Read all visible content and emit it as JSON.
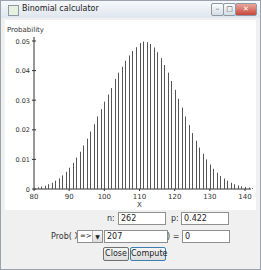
{
  "window": {
    "title": "Binomial calculator",
    "controls": {
      "minimize": "minimize",
      "maximize": "maximize",
      "close": "close"
    }
  },
  "chart_data": {
    "type": "bar",
    "title": "",
    "xlabel": "X",
    "ylabel": "Probability",
    "xlim": [
      80,
      142
    ],
    "ylim": [
      0,
      0.05
    ],
    "x_ticks": [
      "80",
      "90",
      "100",
      "110",
      "120",
      "130",
      "140"
    ],
    "y_ticks": [
      "0",
      "0.01",
      "0.02",
      "0.03",
      "0.04",
      "0.05"
    ],
    "distribution": {
      "n": 262,
      "p": 0.422
    },
    "x": [
      80,
      81,
      82,
      83,
      84,
      85,
      86,
      87,
      88,
      89,
      90,
      91,
      92,
      93,
      94,
      95,
      96,
      97,
      98,
      99,
      100,
      101,
      102,
      103,
      104,
      105,
      106,
      107,
      108,
      109,
      110,
      111,
      112,
      113,
      114,
      115,
      116,
      117,
      118,
      119,
      120,
      121,
      122,
      123,
      124,
      125,
      126,
      127,
      128,
      129,
      130,
      131,
      132,
      133,
      134,
      135,
      136,
      137,
      138,
      139,
      140,
      141,
      142
    ],
    "values": [
      0.0004,
      0.0006,
      0.0008,
      0.0011,
      0.0016,
      0.0021,
      0.0028,
      0.0036,
      0.0046,
      0.0058,
      0.0072,
      0.0088,
      0.0106,
      0.0126,
      0.0147,
      0.017,
      0.0194,
      0.0219,
      0.0245,
      0.027,
      0.0295,
      0.0319,
      0.0341,
      0.0372,
      0.0393,
      0.0413,
      0.0433,
      0.0451,
      0.0466,
      0.0479,
      0.0493,
      0.0498,
      0.0496,
      0.049,
      0.0478,
      0.0462,
      0.0442,
      0.0419,
      0.0393,
      0.0365,
      0.0335,
      0.0305,
      0.0275,
      0.0245,
      0.0216,
      0.0189,
      0.0163,
      0.014,
      0.0119,
      0.01,
      0.0083,
      0.0068,
      0.0055,
      0.0044,
      0.0035,
      0.0028,
      0.0021,
      0.0016,
      0.0012,
      0.0009,
      0.0007,
      0.0005,
      0.0003
    ],
    "grid": false,
    "legend": null
  },
  "form": {
    "n_label": "n:",
    "n_value": "262",
    "p_label": "p:",
    "p_value": "0.422",
    "prob_label": "Prob( X",
    "operator_value": "=>",
    "x_value": "207",
    "equals_label": ") =",
    "result_value": "0"
  },
  "buttons": {
    "close": "Close",
    "compute": "Compute"
  }
}
